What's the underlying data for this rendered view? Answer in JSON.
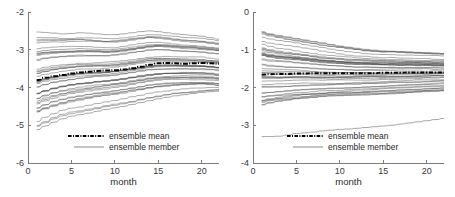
{
  "figure": {
    "background_color": "#ffffff",
    "panel_count": 2
  },
  "legend": {
    "mean_label": "ensemble mean",
    "member_label": "ensemble member",
    "mean_style": "dash-dot thick black",
    "member_style": "thin gray solid"
  },
  "chart_data": [
    {
      "type": "line",
      "panel": "left",
      "title": "",
      "xlabel": "month",
      "ylabel": "",
      "xlim": [
        0,
        22
      ],
      "ylim": [
        -6,
        -2
      ],
      "xticks": [
        0,
        5,
        10,
        15,
        20
      ],
      "yticks": [
        -2,
        -3,
        -4,
        -5,
        -6
      ],
      "xticklabels": [
        "0",
        "5",
        "10",
        "15",
        "20"
      ],
      "yticklabels": [
        "-2",
        "-3",
        "-4",
        "-5",
        "-6"
      ],
      "grid": false,
      "legend_position": "lower center",
      "x": [
        1,
        2,
        3,
        4,
        5,
        6,
        7,
        8,
        9,
        10,
        11,
        12,
        13,
        14,
        15,
        16,
        17,
        18,
        19,
        20,
        21,
        22
      ],
      "series": [
        {
          "name": "ensemble mean",
          "role": "mean",
          "values": [
            -3.8,
            -3.74,
            -3.7,
            -3.67,
            -3.63,
            -3.6,
            -3.58,
            -3.56,
            -3.55,
            -3.54,
            -3.52,
            -3.49,
            -3.45,
            -3.4,
            -3.36,
            -3.35,
            -3.36,
            -3.37,
            -3.36,
            -3.35,
            -3.36,
            -3.37
          ]
        },
        {
          "name": "ensemble envelope upper",
          "role": "envelope_upper",
          "values": [
            -2.53,
            -2.54,
            -2.56,
            -2.58,
            -2.57,
            -2.55,
            -2.56,
            -2.58,
            -2.6,
            -2.6,
            -2.58,
            -2.55,
            -2.52,
            -2.5,
            -2.52,
            -2.55,
            -2.58,
            -2.6,
            -2.62,
            -2.64,
            -2.68,
            -2.72
          ]
        },
        {
          "name": "ensemble envelope lower",
          "role": "envelope_lower",
          "values": [
            -5.12,
            -5.02,
            -4.92,
            -4.83,
            -4.76,
            -4.72,
            -4.68,
            -4.63,
            -4.58,
            -4.54,
            -4.5,
            -4.45,
            -4.4,
            -4.35,
            -4.3,
            -4.26,
            -4.22,
            -4.19,
            -4.16,
            -4.13,
            -4.11,
            -4.1
          ]
        },
        {
          "name": "ensemble core band upper",
          "role": "band_upper",
          "values": [
            -3.05,
            -3.02,
            -3.0,
            -2.99,
            -2.98,
            -2.97,
            -2.98,
            -2.99,
            -3.0,
            -2.99,
            -2.96,
            -2.93,
            -2.9,
            -2.87,
            -2.86,
            -2.87,
            -2.89,
            -2.91,
            -2.92,
            -2.93,
            -2.95,
            -2.97
          ]
        },
        {
          "name": "ensemble core band lower",
          "role": "band_lower",
          "values": [
            -4.55,
            -4.46,
            -4.38,
            -4.32,
            -4.27,
            -4.23,
            -4.19,
            -4.15,
            -4.12,
            -4.09,
            -4.06,
            -4.02,
            -3.98,
            -3.94,
            -3.91,
            -3.89,
            -3.88,
            -3.87,
            -3.87,
            -3.87,
            -3.88,
            -3.9
          ]
        }
      ],
      "member_count": 40,
      "description": "Dense ensemble of member trajectories spanning roughly -4.6 to -3.0, narrowing and rising over 22 months, with a single low outlier member rising from -5.1 to -4.1."
    },
    {
      "type": "line",
      "panel": "right",
      "title": "",
      "xlabel": "month",
      "ylabel": "",
      "xlim": [
        0,
        22
      ],
      "ylim": [
        -4,
        0
      ],
      "xticks": [
        0,
        5,
        10,
        15,
        20
      ],
      "yticks": [
        0,
        -1,
        -2,
        -3,
        -4
      ],
      "xticklabels": [
        "0",
        "5",
        "10",
        "15",
        "20"
      ],
      "yticklabels": [
        "0",
        "-1",
        "-2",
        "-3",
        "-4"
      ],
      "grid": false,
      "legend_position": "lower center",
      "x": [
        1,
        2,
        3,
        4,
        5,
        6,
        7,
        8,
        9,
        10,
        11,
        12,
        13,
        14,
        15,
        16,
        17,
        18,
        19,
        20,
        21,
        22
      ],
      "series": [
        {
          "name": "ensemble mean",
          "role": "mean",
          "values": [
            -1.66,
            -1.65,
            -1.64,
            -1.64,
            -1.63,
            -1.63,
            -1.62,
            -1.62,
            -1.62,
            -1.62,
            -1.62,
            -1.62,
            -1.62,
            -1.62,
            -1.61,
            -1.61,
            -1.61,
            -1.6,
            -1.6,
            -1.6,
            -1.6,
            -1.6
          ]
        },
        {
          "name": "ensemble envelope upper",
          "role": "envelope_upper",
          "values": [
            -0.52,
            -0.58,
            -0.62,
            -0.66,
            -0.7,
            -0.74,
            -0.78,
            -0.82,
            -0.86,
            -0.9,
            -0.93,
            -0.96,
            -0.99,
            -1.01,
            -1.03,
            -1.04,
            -1.05,
            -1.06,
            -1.07,
            -1.08,
            -1.09,
            -1.1
          ]
        },
        {
          "name": "ensemble envelope lower",
          "role": "envelope_lower",
          "values": [
            -2.45,
            -2.4,
            -2.36,
            -2.33,
            -2.3,
            -2.28,
            -2.26,
            -2.24,
            -2.22,
            -2.21,
            -2.2,
            -2.19,
            -2.18,
            -2.17,
            -2.16,
            -2.15,
            -2.14,
            -2.13,
            -2.12,
            -2.11,
            -2.1,
            -2.09
          ]
        },
        {
          "name": "ensemble core band upper",
          "role": "band_upper",
          "values": [
            -0.95,
            -1.0,
            -1.04,
            -1.07,
            -1.1,
            -1.13,
            -1.16,
            -1.19,
            -1.21,
            -1.23,
            -1.25,
            -1.26,
            -1.27,
            -1.28,
            -1.29,
            -1.29,
            -1.3,
            -1.3,
            -1.31,
            -1.31,
            -1.32,
            -1.32
          ]
        },
        {
          "name": "ensemble core band lower",
          "role": "band_lower",
          "values": [
            -2.15,
            -2.13,
            -2.11,
            -2.09,
            -2.07,
            -2.06,
            -2.05,
            -2.04,
            -2.03,
            -2.02,
            -2.01,
            -2.0,
            -1.99,
            -1.98,
            -1.97,
            -1.96,
            -1.95,
            -1.94,
            -1.93,
            -1.92,
            -1.91,
            -1.9
          ]
        },
        {
          "name": "low outlier member",
          "role": "outlier",
          "values": [
            -3.3,
            -3.3,
            -3.29,
            -3.26,
            -3.22,
            -3.2,
            -3.18,
            -3.15,
            -3.13,
            -3.11,
            -3.1,
            -3.08,
            -3.06,
            -3.04,
            -3.02,
            -3.0,
            -2.97,
            -2.94,
            -2.91,
            -2.88,
            -2.85,
            -2.82
          ]
        }
      ],
      "member_count": 40,
      "description": "Dense ensemble of member trajectories centered near -1.6, converging slightly over 22 months, with a single low outlier member rising from -3.3 to -2.8."
    }
  ]
}
